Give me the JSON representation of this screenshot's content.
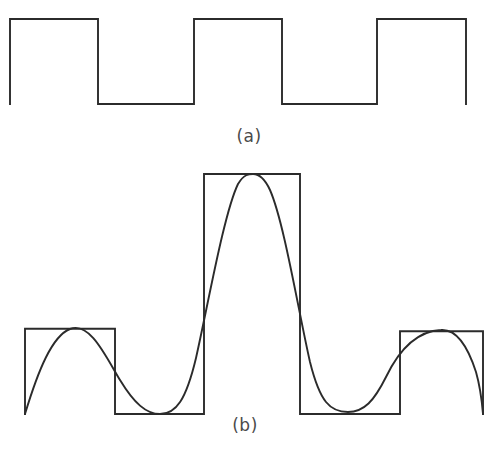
{
  "figure": {
    "background_color": "#ffffff",
    "stroke_color": "#2b2b2b",
    "stroke_width": 1.9,
    "caption_color": "#4a4a4a",
    "width": 498,
    "height": 457
  },
  "panels": [
    {
      "id": "panel-a",
      "caption": "(a)",
      "description": "periodic square wave, constant amplitude",
      "baseline_y": 104,
      "top_y": 19,
      "segments_x": [
        10,
        98,
        194,
        282,
        377,
        466
      ]
    },
    {
      "id": "panel-b",
      "caption": "(b)",
      "description": "amplitude-modulated square wave with overlaid sinusoidal envelope",
      "baseline_y": 414,
      "low_top_y": 329,
      "high_top_y": 174,
      "segments_x": [
        25,
        115,
        204,
        300,
        400,
        483
      ]
    }
  ],
  "chart_data": {
    "type": "line",
    "title": "",
    "xlabel": "",
    "ylabel": "",
    "grid": false,
    "legend": null,
    "xlim": [
      0,
      498
    ],
    "charts": [
      {
        "name": "(a)",
        "type": "line",
        "description": "Square wave (carrier) with constant amplitude, 2.75 periods shown",
        "ylim": [
          0,
          1
        ],
        "square_wave": {
          "levels": [
            1,
            0,
            1,
            0,
            1
          ],
          "x_breaks": [
            10,
            98,
            194,
            282,
            377,
            466
          ],
          "high_value": 1,
          "low_value": 0
        },
        "envelope": null
      },
      {
        "name": "(b)",
        "type": "line",
        "description": "Square wave whose amplitude is modulated by a sinusoid; sine envelope drawn over the pulses",
        "ylim": [
          0,
          1
        ],
        "square_wave": {
          "levels": [
            0.355,
            0,
            1,
            0,
            0.345
          ],
          "x_breaks": [
            25,
            115,
            204,
            300,
            400,
            483
          ],
          "high_value_small": 0.355,
          "high_value_large": 1,
          "low_value": 0
        },
        "envelope": {
          "type": "sinusoid",
          "description": "Smooth sine-like curve tangent to the tops of the small pulses, the top of the tall pulse, and the baseline troughs",
          "tangent_points": [
            {
              "x": 70,
              "y": 329,
              "kind": "small-peak"
            },
            {
              "x": 160,
              "y": 414,
              "kind": "trough"
            },
            {
              "x": 253,
              "y": 174,
              "kind": "main-peak"
            },
            {
              "x": 348,
              "y": 412,
              "kind": "trough"
            },
            {
              "x": 441,
              "y": 330,
              "kind": "small-peak"
            }
          ]
        }
      }
    ]
  }
}
